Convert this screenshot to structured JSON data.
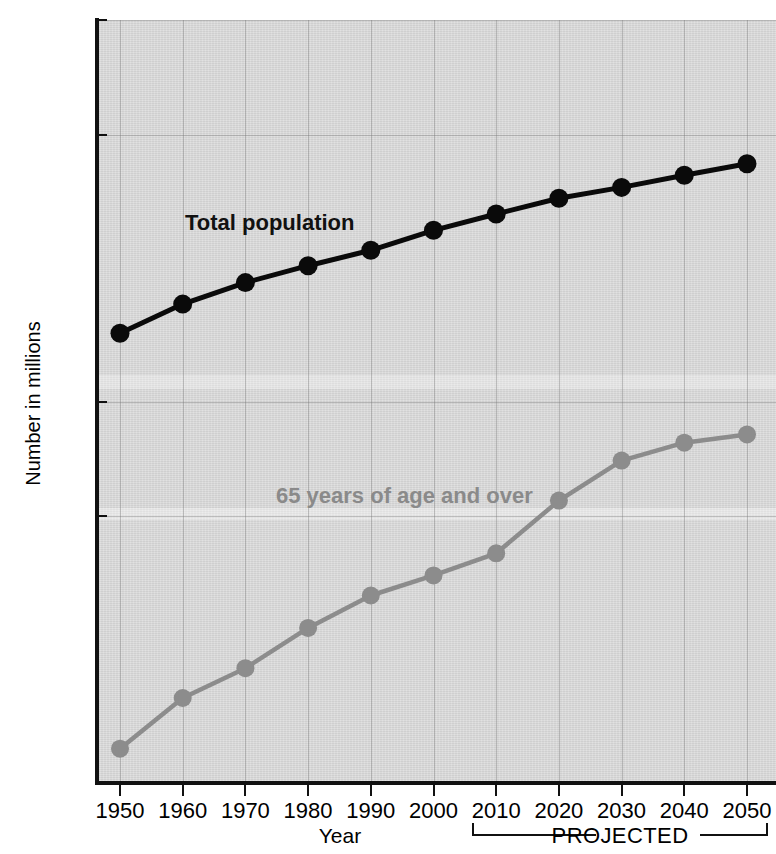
{
  "chart_data": {
    "type": "line",
    "title": "",
    "xlabel": "Year",
    "ylabel": "Number in millions",
    "yscale": "log",
    "ylim": [
      10,
      1000
    ],
    "y_ticks": [
      "1,000",
      "500",
      "100",
      "50",
      "10"
    ],
    "y_tick_values": [
      1000,
      500,
      100,
      50,
      10
    ],
    "x": [
      1950,
      1960,
      1970,
      1980,
      1990,
      2000,
      2010,
      2020,
      2030,
      2040,
      2050
    ],
    "x_tick_labels": [
      "1950",
      "1960",
      "1970",
      "1980",
      "1990",
      "2000",
      "2010",
      "2020",
      "2030",
      "2040",
      "2050"
    ],
    "grid": true,
    "legend_position": "inline-annotations",
    "series": [
      {
        "name": "Total population",
        "color": "#0a0a0a",
        "values": [
          151,
          180,
          205,
          227,
          249,
          281,
          310,
          341,
          364,
          392,
          420
        ]
      },
      {
        "name": "65 years of age and over",
        "color": "#8c8c8c",
        "values": [
          12.3,
          16.7,
          20.0,
          25.5,
          31.0,
          35.0,
          40.0,
          55.0,
          70.0,
          78.0,
          82.0
        ]
      }
    ],
    "annotations": [
      {
        "text": "Total population",
        "color": "#111111"
      },
      {
        "text": "65 years of age and over",
        "color": "#8a8a8a"
      },
      {
        "text": "PROJECTED",
        "color": "#111111",
        "span": [
          2005,
          2050
        ]
      }
    ]
  },
  "axes": {
    "y_title": "Number in millions",
    "x_title": "Year",
    "y_ticks": [
      {
        "label": "1,000",
        "value": 1000
      },
      {
        "label": "500",
        "value": 500
      },
      {
        "label": "100",
        "value": 100
      },
      {
        "label": "50",
        "value": 50
      },
      {
        "label": "10",
        "value": 10
      }
    ],
    "x_ticks": [
      {
        "label": "1950",
        "value": 1950
      },
      {
        "label": "1960",
        "value": 1960
      },
      {
        "label": "1970",
        "value": 1970
      },
      {
        "label": "1980",
        "value": 1980
      },
      {
        "label": "1990",
        "value": 1990
      },
      {
        "label": "2000",
        "value": 2000
      },
      {
        "label": "2010",
        "value": 2010
      },
      {
        "label": "2020",
        "value": 2020
      },
      {
        "label": "2030",
        "value": 2030
      },
      {
        "label": "2040",
        "value": 2040
      },
      {
        "label": "2050",
        "value": 2050
      }
    ]
  },
  "annotations": {
    "total_label": "Total population",
    "older_label": "65 years of age and over",
    "projected_label": "PROJECTED"
  },
  "colors": {
    "total_series": "#0a0a0a",
    "older_series": "#8c8c8c",
    "plot_background": "#d8d8d8",
    "grid": "#787878",
    "axis": "#111111"
  }
}
